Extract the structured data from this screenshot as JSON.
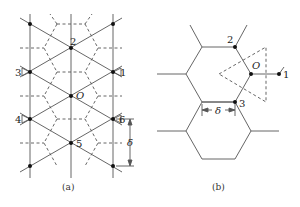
{
  "figure": {
    "panel_a": {
      "caption": "(a)",
      "labels": {
        "n1": "1",
        "n2": "2",
        "n3": "3",
        "n4": "4",
        "n5": "5",
        "n6": "6",
        "origin": "O",
        "delta": "δ"
      }
    },
    "panel_b": {
      "caption": "(b)",
      "labels": {
        "n1": "1",
        "n2": "2",
        "n3": "3",
        "origin": "O",
        "delta": "δ"
      }
    },
    "colors": {
      "line": "#555555",
      "dot": "#111111",
      "background": "#ffffff"
    }
  }
}
